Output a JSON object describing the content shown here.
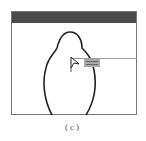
{
  "window": {
    "title_bar_color": "#4a4a4a"
  },
  "canvas": {
    "tooltip": {
      "lines": [
        "",
        ""
      ]
    },
    "cursor_label": "",
    "cursor_icon": "arrow-cursor-icon"
  },
  "caption": "(c)"
}
